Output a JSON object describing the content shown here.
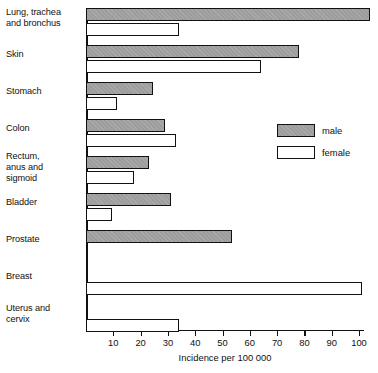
{
  "chart_data": {
    "type": "bar",
    "orientation": "horizontal",
    "title": "",
    "xlabel": "Incidence per 100 000",
    "ylabel": "",
    "xlim": [
      0,
      105
    ],
    "xticks": [
      10,
      20,
      30,
      40,
      50,
      60,
      70,
      80,
      90,
      100
    ],
    "xtick_labels": [
      "10",
      "20",
      "30",
      "40",
      "50",
      "60",
      "70",
      "80",
      "90",
      "100"
    ],
    "grid": false,
    "legend_position": "right-middle",
    "categories": [
      "Lung, trachea\nand bronchus",
      "Skin",
      "Stomach",
      "Colon",
      "Rectum,\nanus and\nsigmoid",
      "Bladder",
      "Prostate",
      "Breast",
      "Uterus and\ncervix"
    ],
    "series": [
      {
        "name": "male",
        "color": "#9d9d9d",
        "values": [
          104,
          78,
          24.5,
          29,
          23,
          31,
          53.5,
          null,
          null
        ]
      },
      {
        "name": "female",
        "color": "#ffffff",
        "values": [
          34,
          64,
          11.5,
          33,
          17.5,
          9.5,
          null,
          101,
          34
        ]
      }
    ]
  },
  "legend": {
    "items": [
      {
        "label": "male",
        "swatch": "male"
      },
      {
        "label": "female",
        "swatch": "female"
      }
    ]
  },
  "axis": {
    "x_title": "Incidence per 100 000"
  }
}
